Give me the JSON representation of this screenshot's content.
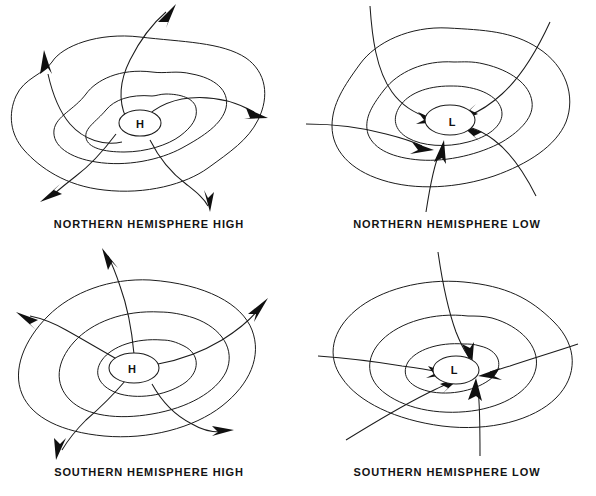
{
  "figure": {
    "background_color": "#ffffff",
    "line_color": "#1c1c1c",
    "text_color": "#131313"
  },
  "panels": [
    {
      "id": "northern-hemisphere-high",
      "label": "NORTHERN  HEMISPHERE  HIGH",
      "center_symbol": "H",
      "hemisphere": "Northern",
      "pressure_system": "High",
      "flow": "outflow",
      "rotation": "clockwise",
      "isobar_count": 3,
      "streamline_count": 4,
      "arrow_count": 4
    },
    {
      "id": "northern-hemisphere-low",
      "label": "NORTHERN  HEMISPHERE  LOW",
      "center_symbol": "L",
      "hemisphere": "Northern",
      "pressure_system": "Low",
      "flow": "inflow",
      "rotation": "counterclockwise",
      "isobar_count": 3,
      "streamline_count": 5,
      "arrow_count": 5
    },
    {
      "id": "southern-hemisphere-high",
      "label": "SOUTHERN  HEMISPHERE  HIGH",
      "center_symbol": "H",
      "hemisphere": "Southern",
      "pressure_system": "High",
      "flow": "outflow",
      "rotation": "counterclockwise",
      "isobar_count": 3,
      "streamline_count": 4,
      "arrow_count": 4
    },
    {
      "id": "southern-hemisphere-low",
      "label": "SOUTHERN  HEMISPHERE  LOW",
      "center_symbol": "L",
      "hemisphere": "Southern",
      "pressure_system": "Low",
      "flow": "inflow",
      "rotation": "clockwise",
      "isobar_count": 3,
      "streamline_count": 5,
      "arrow_count": 5
    }
  ]
}
